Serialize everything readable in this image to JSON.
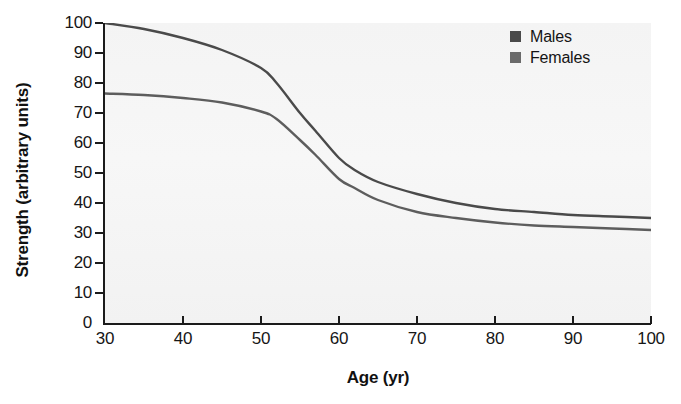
{
  "chart_data": {
    "type": "line",
    "title": "",
    "xlabel": "Age (yr)",
    "ylabel": "Strength (arbitrary units)",
    "xlim": [
      30,
      100
    ],
    "ylim": [
      0,
      100
    ],
    "xticks": [
      30,
      40,
      50,
      60,
      70,
      80,
      90,
      100
    ],
    "yticks": [
      0,
      10,
      20,
      30,
      40,
      50,
      60,
      70,
      80,
      90,
      100
    ],
    "grid": false,
    "legend_position": "top-right",
    "x": [
      30,
      35,
      40,
      45,
      50,
      52,
      55,
      57,
      60,
      62,
      65,
      70,
      75,
      80,
      85,
      90,
      95,
      100
    ],
    "series": [
      {
        "name": "Males",
        "color": "#4a4a4a",
        "values": [
          100,
          98,
          95,
          91,
          85,
          80,
          70,
          64,
          55,
          51,
          47,
          43,
          40,
          38,
          37,
          36,
          35.5,
          35
        ]
      },
      {
        "name": "Females",
        "color": "#5d5d5d",
        "values": [
          76.5,
          76,
          75,
          73.5,
          70.5,
          68,
          61,
          56,
          48,
          45,
          41,
          37,
          35,
          33.5,
          32.5,
          32,
          31.5,
          31
        ]
      }
    ]
  },
  "legend": {
    "items": [
      {
        "label": "Males",
        "color": "#4a4a4a"
      },
      {
        "label": "Females",
        "color": "#6a6a6a"
      }
    ]
  },
  "axes": {
    "x_title": "Age (yr)",
    "y_title": "Strength (arbitrary units)",
    "x_tick_labels": [
      "30",
      "40",
      "50",
      "60",
      "70",
      "80",
      "90",
      "100"
    ],
    "y_tick_labels": [
      "0",
      "10",
      "20",
      "30",
      "40",
      "50",
      "60",
      "70",
      "80",
      "90",
      "100"
    ]
  },
  "colors": {
    "panel_background": "#f4f4f4",
    "axis": "#1b1b1b",
    "text": "#141414"
  }
}
